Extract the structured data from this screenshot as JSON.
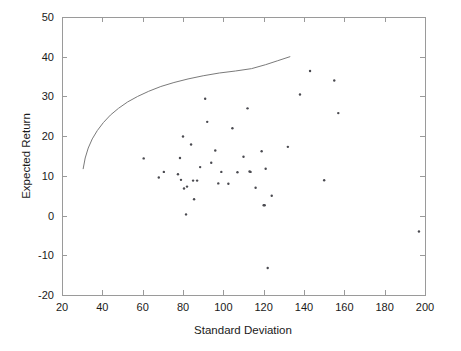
{
  "figure": {
    "background_color": "#ffffff",
    "axis_color": "#9a9a9a",
    "marker_color": "#4a4a50",
    "curve_color": "#7a7a7a"
  },
  "chart_data": {
    "type": "scatter",
    "title": "",
    "xlabel": "Standard Deviation",
    "ylabel": "Expected Return",
    "xlim": [
      20,
      200
    ],
    "ylim": [
      -20,
      50
    ],
    "xticks": [
      20,
      40,
      60,
      80,
      100,
      120,
      140,
      160,
      180,
      200
    ],
    "xticklabels": [
      "20",
      "40",
      "60",
      "80",
      "100",
      "120",
      "140",
      "160",
      "180",
      "200"
    ],
    "yticks": [
      -20,
      -10,
      0,
      10,
      20,
      30,
      40,
      50
    ],
    "yticklabels": [
      "-20",
      "-10",
      "0",
      "10",
      "20",
      "30",
      "40",
      "50"
    ],
    "grid": false,
    "legend": null,
    "series": [
      {
        "name": "Individual Assets",
        "type": "scatter",
        "marker": "dot",
        "points": [
          [
            60.5,
            14.4
          ],
          [
            68.0,
            9.6
          ],
          [
            70.5,
            11.0
          ],
          [
            77.5,
            10.4
          ],
          [
            78.5,
            14.5
          ],
          [
            79.0,
            9.0
          ],
          [
            80.0,
            19.9
          ],
          [
            80.5,
            6.8
          ],
          [
            81.5,
            0.3
          ],
          [
            82.0,
            7.3
          ],
          [
            84.0,
            17.9
          ],
          [
            85.0,
            8.8
          ],
          [
            85.5,
            4.1
          ],
          [
            87.0,
            8.8
          ],
          [
            88.5,
            12.2
          ],
          [
            91.0,
            29.4
          ],
          [
            92.0,
            23.6
          ],
          [
            94.0,
            13.3
          ],
          [
            96.0,
            16.4
          ],
          [
            97.5,
            8.1
          ],
          [
            99.0,
            11.0
          ],
          [
            102.5,
            8.0
          ],
          [
            104.5,
            22.0
          ],
          [
            107.0,
            10.9
          ],
          [
            110.0,
            14.8
          ],
          [
            112.0,
            27.0
          ],
          [
            113.0,
            11.1
          ],
          [
            113.5,
            11.0
          ],
          [
            116.0,
            7.0
          ],
          [
            119.0,
            16.2
          ],
          [
            120.0,
            2.6
          ],
          [
            120.5,
            2.6
          ],
          [
            121.0,
            11.8
          ],
          [
            122.0,
            -13.2
          ],
          [
            124.0,
            5.0
          ],
          [
            132.0,
            17.3
          ],
          [
            138.0,
            30.5
          ],
          [
            143.0,
            36.4
          ],
          [
            150.0,
            8.9
          ],
          [
            155.0,
            34.0
          ],
          [
            157.0,
            25.8
          ],
          [
            197.0,
            -4.0
          ]
        ]
      },
      {
        "name": "Efficient Frontier",
        "type": "line",
        "points": [
          [
            30.5,
            11.8
          ],
          [
            31.5,
            14.5
          ],
          [
            33.0,
            17.0
          ],
          [
            35.0,
            19.3
          ],
          [
            37.5,
            21.4
          ],
          [
            40.5,
            23.4
          ],
          [
            44.0,
            25.3
          ],
          [
            48.0,
            27.0
          ],
          [
            52.5,
            28.6
          ],
          [
            57.5,
            30.0
          ],
          [
            63.0,
            31.3
          ],
          [
            69.0,
            32.5
          ],
          [
            75.5,
            33.5
          ],
          [
            82.5,
            34.4
          ],
          [
            90.0,
            35.2
          ],
          [
            98.0,
            35.9
          ],
          [
            106.0,
            36.4
          ],
          [
            114.0,
            37.0
          ],
          [
            121.0,
            38.0
          ],
          [
            127.0,
            39.0
          ],
          [
            133.0,
            40.0
          ]
        ]
      }
    ]
  }
}
